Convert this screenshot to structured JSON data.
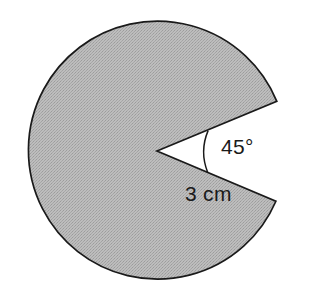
{
  "figure": {
    "kind": "circle-sector-diagram",
    "background_color": "#ffffff",
    "shape": {
      "name": "major-sector",
      "fill_color": "#b0b0b0",
      "fill_style": "dithered-gray-halftone",
      "stroke_color": "#1a1a1a",
      "stroke_width": 1.7,
      "center_x": 157,
      "center_y": 151,
      "radius_px": 129,
      "notch_angle_deg": 45,
      "notch_upper_edge_deg": 21.7,
      "notch_lower_edge_deg": -22.9,
      "shaded_sweep_deg": 315
    },
    "angle_arc": {
      "name": "angle-arc",
      "stroke_color": "#1a1a1a",
      "radius_px": 55
    },
    "labels": {
      "angle": "45°",
      "radius": "3 cm"
    }
  }
}
